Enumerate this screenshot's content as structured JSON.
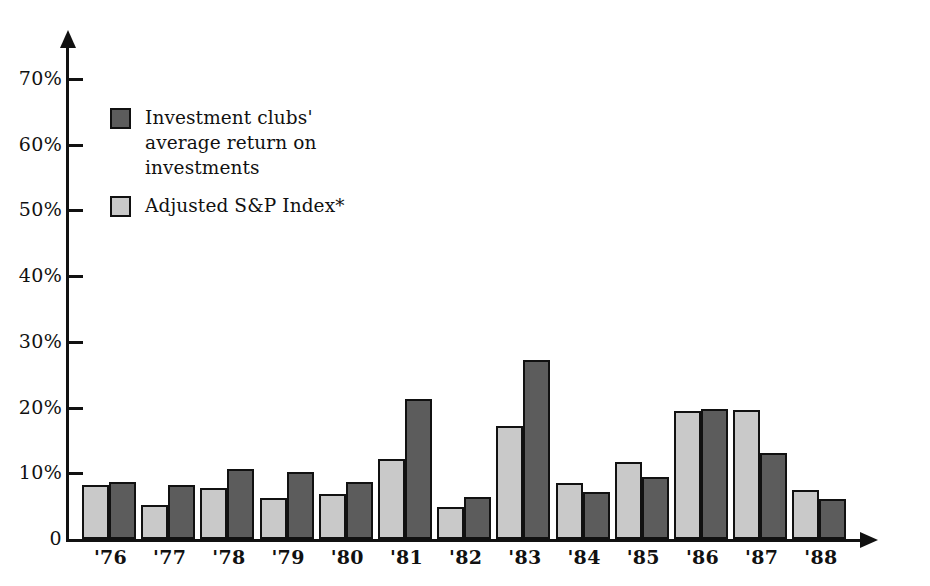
{
  "chart_data": {
    "type": "bar",
    "title": "",
    "subtitle": "",
    "xlabel": "",
    "ylabel": "",
    "ylim": [
      0,
      75
    ],
    "grid": false,
    "legend_position": "inside-top-left",
    "categories": [
      "'76",
      "'77",
      "'78",
      "'79",
      "'80",
      "'81",
      "'82",
      "'83",
      "'84",
      "'85",
      "'86",
      "'87",
      "'88"
    ],
    "series": [
      {
        "name": "Adjusted S&P Index*",
        "color": "#c9c9c9",
        "values": [
          8.2,
          5.1,
          7.8,
          6.2,
          6.8,
          12.1,
          4.8,
          17.2,
          8.5,
          11.7,
          19.4,
          19.7,
          7.5
        ]
      },
      {
        "name": "Investment clubs' average return on investments",
        "color": "#5c5c5c",
        "values": [
          8.6,
          8.2,
          10.7,
          10.2,
          8.6,
          21.3,
          6.4,
          27.2,
          7.2,
          9.4,
          19.8,
          13.1,
          6.1
        ]
      }
    ],
    "y_ticks": [
      {
        "value": 0,
        "label": "0"
      },
      {
        "value": 10,
        "label": "10%"
      },
      {
        "value": 20,
        "label": "20%"
      },
      {
        "value": 30,
        "label": "30%"
      },
      {
        "value": 40,
        "label": "40%"
      },
      {
        "value": 50,
        "label": "50%"
      },
      {
        "value": 60,
        "label": "60%"
      },
      {
        "value": 70,
        "label": "70%"
      }
    ],
    "legend": [
      {
        "swatch": "dark",
        "label": "Investment clubs'\naverage return on\ninvestments"
      },
      {
        "swatch": "light",
        "label": "Adjusted S&P Index*"
      }
    ]
  },
  "colors": {
    "series_dark": "#5c5c5c",
    "series_light": "#c9c9c9",
    "ink": "#111111",
    "background": "#ffffff"
  }
}
